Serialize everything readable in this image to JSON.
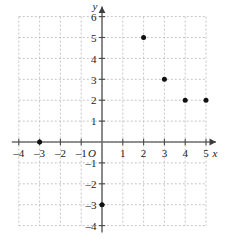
{
  "chart_data": {
    "type": "scatter",
    "title": "",
    "xlabel": "x",
    "ylabel": "y",
    "xlim": [
      -4,
      5
    ],
    "ylim": [
      -4,
      6
    ],
    "grid": true,
    "legend": false,
    "origin_label": "O",
    "x_ticks": [
      -4,
      -3,
      -2,
      -1,
      1,
      2,
      3,
      4,
      5
    ],
    "y_ticks": [
      -4,
      -3,
      -2,
      -1,
      1,
      2,
      3,
      4,
      5,
      6
    ],
    "x_tick_labels": [
      "–4",
      "–3",
      "–2",
      "–1",
      "1",
      "2",
      "3",
      "4",
      "5"
    ],
    "y_tick_labels": [
      "–4",
      "–3",
      "–2",
      "–1",
      "1",
      "2",
      "3",
      "4",
      "5",
      "6"
    ],
    "points": [
      {
        "x": -3,
        "y": 0
      },
      {
        "x": 0,
        "y": -3
      },
      {
        "x": 2,
        "y": 5
      },
      {
        "x": 3,
        "y": 3
      },
      {
        "x": 4,
        "y": 2
      },
      {
        "x": 5,
        "y": 2
      }
    ],
    "colors": {
      "point": "#111111",
      "axis": "#6e6e6e",
      "grid": "#b8b8b8",
      "text": "#1a1a1a",
      "background": "#ffffff"
    }
  }
}
